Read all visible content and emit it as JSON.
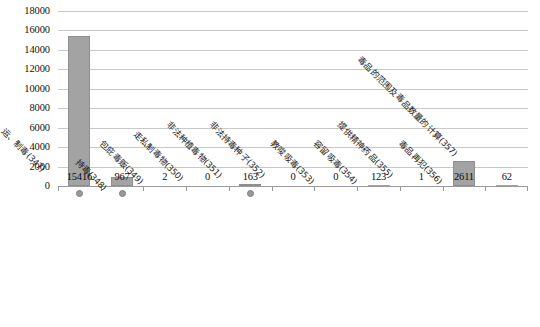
{
  "chart_data": {
    "type": "bar",
    "title": "",
    "subtitle": "",
    "xlabel": "",
    "ylabel": "",
    "ylim": [
      0,
      18000
    ],
    "ytick_step": 2000,
    "grid": true,
    "legend": false,
    "legend_position": "none",
    "bar_color": "#a3a3a3",
    "marker_color": "#999999",
    "gridline_color": "#c9c9c9",
    "yticks": [
      "18000",
      "16000",
      "14000",
      "12000",
      "10000",
      "8000",
      "6000",
      "4000",
      "2000",
      "0"
    ],
    "categories": [
      "走、贩、运、制毒(347)",
      "持毒(348)",
      "包庇毒贩(349)",
      "走私制毒物(350)",
      "非法种植毒物(351)",
      "非法持毒种子(352)",
      "教唆吸毒(353)",
      "容留吸毒(354)",
      "提供精神药品(355)",
      "毒品再犯(356)",
      "毒品的范围及毒品数量的计算(357)"
    ],
    "values": [
      15416,
      967,
      2,
      0,
      163,
      0,
      0,
      123,
      1,
      2611,
      62
    ],
    "value_labels": [
      "15416",
      "967",
      "2",
      "0",
      "163",
      "0",
      "0",
      "123",
      "1",
      "2611",
      "62"
    ],
    "markers": [
      true,
      true,
      false,
      false,
      true,
      false,
      false,
      false,
      false,
      false,
      false
    ]
  }
}
